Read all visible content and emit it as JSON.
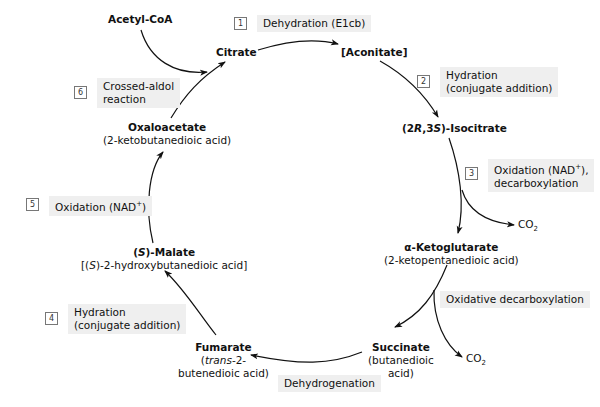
{
  "compounds": {
    "acetyl_coa": {
      "name": "Acetyl-CoA"
    },
    "citrate": {
      "name": "Citrate"
    },
    "aconitate": {
      "name": "[Aconitate]"
    },
    "isocitrate": {
      "name_pre": "(2",
      "name_r": "R",
      "name_mid": ",3",
      "name_s": "S",
      "name_post": ")-Isocitrate"
    },
    "alpha_ketoglutarate": {
      "name": "α-Ketoglutarate",
      "iupac": "(2-ketopentanedioic acid)"
    },
    "succinate": {
      "name": "Succinate",
      "iupac_line1": "(butanedioic",
      "iupac_line2": "acid)"
    },
    "fumarate": {
      "name": "Fumarate",
      "iupac_line1_pre": "(",
      "iupac_line1_it": "trans",
      "iupac_line1_post": "-2-",
      "iupac_line2": "butenedioic acid)"
    },
    "malate": {
      "name_pre": "(",
      "name_it": "S",
      "name_post": ")-Malate",
      "iupac_pre": "[(",
      "iupac_it": "S",
      "iupac_post": ")-2-hydroxybutanedioic acid]"
    },
    "oxaloacetate": {
      "name": "Oxaloacetate",
      "iupac": "(2-ketobutanedioic acid)"
    }
  },
  "steps": [
    {
      "number": "1",
      "label": "Dehydration (E1cb)"
    },
    {
      "number": "2",
      "label_line1": "Hydration",
      "label_line2": "(conjugate addition)"
    },
    {
      "number": "3",
      "label_line1_pre": "Oxidation (NAD",
      "label_line1_sup": "+",
      "label_line1_post": "),",
      "label_line2": "decarboxylation"
    },
    {
      "number": "4",
      "label_line1": "Hydration",
      "label_line2": "(conjugate addition)"
    },
    {
      "number": "5",
      "label_pre": "Oxidation (NAD",
      "label_sup": "+",
      "label_post": ")"
    },
    {
      "number": "6",
      "label_line1": "Crossed-aldol",
      "label_line2": "reaction"
    }
  ],
  "unnumbered_steps": {
    "oxidative_decarboxylation": "Oxidative decarboxylation",
    "dehydrogenation": "Dehydrogenation"
  },
  "byproducts": {
    "co2_a": {
      "main": "CO",
      "sub": "2"
    },
    "co2_b": {
      "main": "CO",
      "sub": "2"
    }
  },
  "colors": {
    "label_bg": "#efefef",
    "arrow": "#111111"
  }
}
